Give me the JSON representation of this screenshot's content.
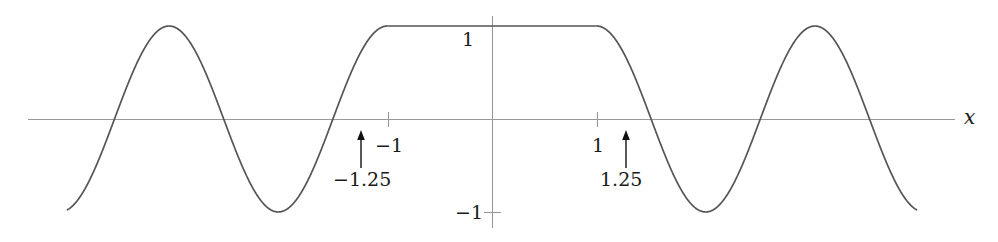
{
  "figure": {
    "width": 998,
    "height": 242,
    "background": "#ffffff",
    "curve_color": "#555555",
    "axis_color": "#999999",
    "annotation_color": "#1a1a1a"
  },
  "axes": {
    "x_axis_label": "x",
    "y_axis_label": "",
    "x_ticks": [
      {
        "value": -1,
        "label": "−1"
      },
      {
        "value": 1,
        "label": "1"
      }
    ],
    "y_ticks": [
      {
        "value": 1,
        "label": "1"
      },
      {
        "value": -1,
        "label": "−1"
      }
    ],
    "xlim": [
      -4.45,
      4.45
    ],
    "ylim": [
      -1.28,
      1.28
    ],
    "grid": false,
    "origin_px": {
      "x": 492,
      "y": 119
    },
    "unit_px": {
      "x": 104.5,
      "y": 93
    }
  },
  "annotations": [
    {
      "name": "left-marker",
      "label": "−1.25",
      "x_value": -1.25,
      "arrow": "up",
      "label_px": {
        "x": 335,
        "y": 176
      },
      "arrow_px": {
        "x": 361,
        "y": 134,
        "length": 34
      }
    },
    {
      "name": "right-marker",
      "label": "1.25",
      "x_value": 1.25,
      "arrow": "up",
      "label_px": {
        "x": 601,
        "y": 176
      },
      "arrow_px": {
        "x": 626,
        "y": 134,
        "length": 34
      }
    }
  ],
  "chart_data": {
    "type": "line",
    "title": "",
    "xlabel": "x",
    "ylabel": "",
    "xlim": [
      -4.45,
      4.45
    ],
    "ylim": [
      -1.28,
      1.28
    ],
    "grid": false,
    "legend": null,
    "series": [
      {
        "name": "f(x)",
        "color": "#555555",
        "x": [
          -4.05,
          -3.98,
          -3.9,
          -3.82,
          -3.74,
          -3.66,
          -3.58,
          -3.5,
          -3.42,
          -3.34,
          -3.26,
          -3.18,
          -3.1,
          -3.02,
          -2.94,
          -2.86,
          -2.78,
          -2.7,
          -2.62,
          -2.54,
          -2.46,
          -2.38,
          -2.3,
          -2.22,
          -2.14,
          -2.06,
          -1.98,
          -1.9,
          -1.82,
          -1.74,
          -1.66,
          -1.58,
          -1.5,
          -1.42,
          -1.34,
          -1.25,
          -1.15,
          -1.05,
          -0.95,
          -0.85,
          -0.7,
          -0.5,
          -0.25,
          0,
          0.25,
          0.5,
          0.7,
          0.85,
          0.95,
          1.05,
          1.15,
          1.25,
          1.34,
          1.42,
          1.5,
          1.58,
          1.66,
          1.74,
          1.82,
          1.9,
          1.98,
          2.06,
          2.14,
          2.22,
          2.3,
          2.38,
          2.46,
          2.54,
          2.62,
          2.7,
          2.78,
          2.86,
          2.94,
          3.02,
          3.1,
          3.18,
          3.26,
          3.34,
          3.42,
          3.5,
          3.58,
          3.66,
          3.74,
          3.82,
          3.9,
          3.98,
          4.05
        ],
        "y": [
          -1.0,
          -0.96,
          -0.82,
          -0.58,
          -0.26,
          0.1,
          0.46,
          0.76,
          0.95,
          1.0,
          0.92,
          0.71,
          0.39,
          0.03,
          -0.34,
          -0.66,
          -0.89,
          -1.0,
          -0.98,
          -0.84,
          -0.57,
          -0.22,
          0.17,
          0.54,
          0.82,
          0.98,
          1.0,
          0.87,
          0.61,
          0.26,
          -0.13,
          -0.5,
          -0.78,
          -0.95,
          -1.0,
          -0.93,
          -0.7,
          -0.35,
          0.06,
          0.46,
          0.84,
          0.99,
          1.0,
          1.0,
          1.0,
          0.99,
          0.84,
          0.46,
          0.06,
          -0.35,
          -0.7,
          -0.93,
          -1.0,
          -0.95,
          -0.78,
          -0.5,
          -0.13,
          0.26,
          0.61,
          0.87,
          1.0,
          0.98,
          0.82,
          0.54,
          0.17,
          -0.22,
          -0.57,
          -0.84,
          -0.98,
          -1.0,
          -0.89,
          -0.66,
          -0.34,
          0.03,
          0.39,
          0.71,
          0.92,
          1.0,
          0.95,
          0.76,
          0.46,
          0.1,
          -0.26,
          -0.58,
          -0.82,
          -0.96,
          -1.0
        ]
      }
    ],
    "marked_points": [
      {
        "x": -1.25,
        "y": 0,
        "label": "−1.25"
      },
      {
        "x": 1.25,
        "y": 0,
        "label": "1.25"
      }
    ],
    "x_tick_labels": [
      "−1",
      "1"
    ],
    "y_tick_labels": [
      "1",
      "−1"
    ]
  }
}
